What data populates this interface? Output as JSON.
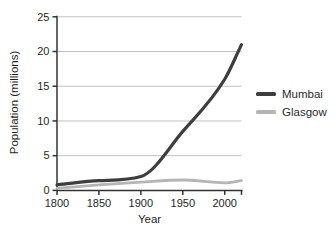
{
  "chart_data": {
    "type": "line",
    "title": "",
    "xlabel": "Year",
    "ylabel": "Population (millions)",
    "x": [
      1800,
      1850,
      1900,
      1950,
      2000,
      2020
    ],
    "x_tick_years": [
      1800,
      1850,
      1900,
      1950,
      2000
    ],
    "xlim": [
      1800,
      2020
    ],
    "ylim": [
      0,
      25
    ],
    "yticks": [
      0,
      5,
      10,
      15,
      20,
      25
    ],
    "grid": "horizontal",
    "legend_position": "right",
    "series": [
      {
        "name": "Mumbai",
        "color": "#3e3e3e",
        "line_width": 3.2,
        "values": [
          0.8,
          1.4,
          2.0,
          8.5,
          16.0,
          21.0
        ]
      },
      {
        "name": "Glasgow",
        "color": "#b5b5b5",
        "line_width": 2.8,
        "values": [
          0.3,
          0.8,
          1.2,
          1.5,
          1.1,
          1.4
        ]
      }
    ],
    "axis_color": "#333333",
    "grid_color": "#c2c2c2",
    "text_color": "#1f1f1f",
    "background": "#ffffff"
  }
}
